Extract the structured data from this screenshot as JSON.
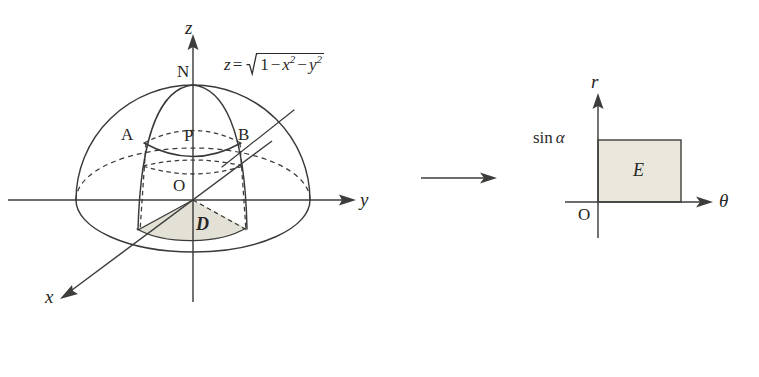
{
  "figure": {
    "background_color": "#ffffff",
    "ink_color": "#3a3a38",
    "shade_color": "#e3e0d6",
    "rect_fill_color": "#e9e6dc"
  },
  "left_diagram": {
    "name": "hemisphere-diagram",
    "surface_equation": {
      "lhs": "z",
      "equals": "=",
      "radicand_first": "1",
      "minus_one": "−",
      "term_x": "x",
      "exp_x": "2",
      "minus_two": "−",
      "term_y": "y",
      "exp_y": "2",
      "plain": "z = √(1 − x² − y²)"
    },
    "axes": [
      {
        "name": "z-axis",
        "label": "z",
        "direction": "up"
      },
      {
        "name": "y-axis",
        "label": "y",
        "direction": "right"
      },
      {
        "name": "x-axis",
        "label": "x",
        "direction": "down-left"
      }
    ],
    "points": [
      {
        "name": "north-pole",
        "label": "N"
      },
      {
        "name": "point-a",
        "label": "A"
      },
      {
        "name": "point-p",
        "label": "P"
      },
      {
        "name": "point-b",
        "label": "B"
      },
      {
        "name": "origin",
        "label": "O"
      }
    ],
    "regions": [
      {
        "name": "region-d",
        "label": "D",
        "shaded": true
      }
    ]
  },
  "map_arrow": {
    "name": "mapping-arrow",
    "direction": "right"
  },
  "right_diagram": {
    "name": "polar-rectangle-diagram",
    "axes": [
      {
        "name": "r-axis",
        "label": "r",
        "direction": "up"
      },
      {
        "name": "theta-axis",
        "label": "θ",
        "direction": "right"
      }
    ],
    "origin_label": "O",
    "tick_label": {
      "function": "sin",
      "variable": "α",
      "plain": "sin α"
    },
    "region": {
      "name": "region-e",
      "label": "E",
      "shaded": true
    }
  }
}
